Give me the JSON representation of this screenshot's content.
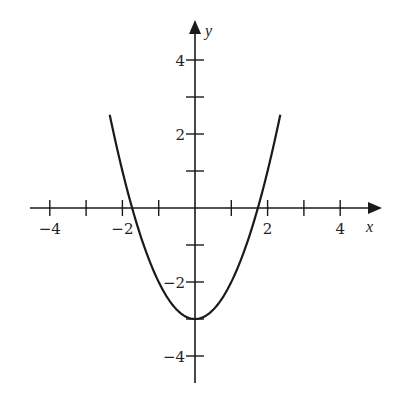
{
  "chart_data": {
    "type": "line",
    "title": "",
    "xlabel": "x",
    "ylabel": "y",
    "function": "y = x^2 - 3",
    "xlim": [
      -4.5,
      5
    ],
    "ylim": [
      -5,
      5
    ],
    "grid": false,
    "legend": null,
    "x_ticks": [
      -4,
      -3,
      -2,
      -1,
      1,
      2,
      3,
      4
    ],
    "x_tick_labels": [
      {
        "value": -4,
        "label": "−4"
      },
      {
        "value": -2,
        "label": "−2"
      },
      {
        "value": 2,
        "label": "2"
      },
      {
        "value": 4,
        "label": "4"
      }
    ],
    "y_ticks": [
      -4,
      -3,
      -2,
      -1,
      1,
      2,
      3,
      4
    ],
    "y_tick_labels": [
      {
        "value": 4,
        "label": "4"
      },
      {
        "value": 2,
        "label": "2"
      },
      {
        "value": -2,
        "label": "−2"
      },
      {
        "value": -4,
        "label": "−4"
      }
    ],
    "series": [
      {
        "name": "parabola",
        "x": [
          -2.35,
          -2,
          -1.732,
          -1.5,
          -1,
          -0.5,
          0,
          0.5,
          1,
          1.5,
          1.732,
          2,
          2.35
        ],
        "y": [
          2.52,
          1,
          0,
          -0.75,
          -2,
          -2.75,
          -3,
          -2.75,
          -2,
          -0.75,
          0,
          1,
          2.52
        ]
      }
    ],
    "annotations": {
      "vertex": [
        0,
        -3
      ],
      "x_intercepts": [
        -1.732,
        1.732
      ]
    }
  },
  "axes": {
    "x_name": "x",
    "y_name": "y"
  }
}
